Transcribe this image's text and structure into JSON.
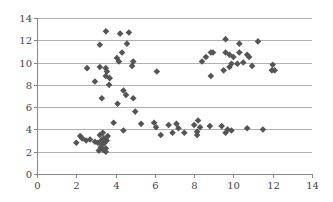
{
  "chart_data": {
    "type": "scatter",
    "title": "",
    "xlabel": "",
    "ylabel": "",
    "xlim": [
      0,
      14
    ],
    "ylim": [
      0,
      14
    ],
    "x_ticks": [
      0,
      2,
      4,
      6,
      8,
      10,
      12,
      14
    ],
    "y_ticks": [
      0,
      2,
      4,
      6,
      8,
      10,
      12,
      14
    ],
    "grid": "horizontal",
    "legend": "none",
    "marker": "diamond",
    "marker_color": "#555555",
    "grid_color": "#b0b0b0",
    "series": [
      {
        "name": "",
        "points": [
          [
            2.0,
            2.8
          ],
          [
            2.2,
            3.4
          ],
          [
            2.3,
            3.2
          ],
          [
            2.5,
            3.0
          ],
          [
            2.7,
            3.1
          ],
          [
            2.95,
            2.9
          ],
          [
            3.1,
            2.8
          ],
          [
            3.2,
            3.5
          ],
          [
            3.27,
            3.0
          ],
          [
            3.35,
            3.7
          ],
          [
            3.25,
            2.4
          ],
          [
            3.35,
            2.2
          ],
          [
            3.45,
            2.8
          ],
          [
            3.5,
            2.3
          ],
          [
            3.55,
            3.0
          ],
          [
            3.4,
            3.2
          ],
          [
            3.3,
            2.6
          ],
          [
            3.6,
            3.4
          ],
          [
            3.15,
            2.1
          ],
          [
            3.5,
            2.0
          ],
          [
            3.51,
            12.8
          ],
          [
            4.23,
            12.6
          ],
          [
            4.68,
            12.7
          ],
          [
            3.2,
            11.6
          ],
          [
            4.58,
            11.7
          ],
          [
            4.33,
            10.9
          ],
          [
            4.07,
            10.4
          ],
          [
            4.17,
            10.1
          ],
          [
            4.9,
            10.1
          ],
          [
            4.84,
            9.7
          ],
          [
            2.55,
            9.5
          ],
          [
            3.2,
            9.6
          ],
          [
            3.5,
            9.5
          ],
          [
            3.56,
            9.2
          ],
          [
            3.7,
            8.6
          ],
          [
            3.5,
            8.8
          ],
          [
            2.95,
            8.3
          ],
          [
            3.67,
            8.0
          ],
          [
            4.4,
            7.5
          ],
          [
            4.53,
            7.1
          ],
          [
            3.3,
            6.8
          ],
          [
            4.9,
            6.8
          ],
          [
            4.1,
            6.3
          ],
          [
            5.0,
            5.6
          ],
          [
            3.9,
            4.6
          ],
          [
            5.3,
            4.5
          ],
          [
            4.4,
            3.9
          ],
          [
            5.96,
            4.6
          ],
          [
            6.06,
            4.2
          ],
          [
            6.3,
            3.5
          ],
          [
            6.7,
            4.4
          ],
          [
            6.9,
            3.7
          ],
          [
            7.1,
            4.5
          ],
          [
            7.2,
            4.1
          ],
          [
            7.5,
            3.7
          ],
          [
            8.0,
            4.4
          ],
          [
            8.2,
            4.8
          ],
          [
            8.3,
            4.2
          ],
          [
            8.15,
            3.8
          ],
          [
            8.15,
            3.5
          ],
          [
            8.8,
            4.3
          ],
          [
            9.4,
            4.3
          ],
          [
            9.6,
            3.7
          ],
          [
            9.7,
            4.0
          ],
          [
            9.9,
            3.9
          ],
          [
            10.7,
            4.1
          ],
          [
            11.5,
            4.0
          ],
          [
            6.1,
            9.2
          ],
          [
            9.6,
            12.1
          ],
          [
            10.3,
            11.7
          ],
          [
            11.25,
            11.9
          ],
          [
            8.4,
            10.1
          ],
          [
            8.6,
            10.5
          ],
          [
            8.85,
            10.9
          ],
          [
            8.96,
            10.9
          ],
          [
            9.6,
            10.9
          ],
          [
            9.8,
            10.7
          ],
          [
            10.0,
            10.5
          ],
          [
            10.3,
            10.9
          ],
          [
            10.7,
            10.7
          ],
          [
            10.8,
            10.5
          ],
          [
            10.5,
            10.0
          ],
          [
            10.2,
            9.9
          ],
          [
            10.95,
            9.7
          ],
          [
            9.9,
            9.9
          ],
          [
            9.8,
            9.6
          ],
          [
            9.5,
            9.3
          ],
          [
            8.85,
            8.8
          ],
          [
            12.0,
            9.8
          ],
          [
            11.96,
            9.3
          ],
          [
            12.1,
            9.3
          ]
        ]
      }
    ]
  }
}
